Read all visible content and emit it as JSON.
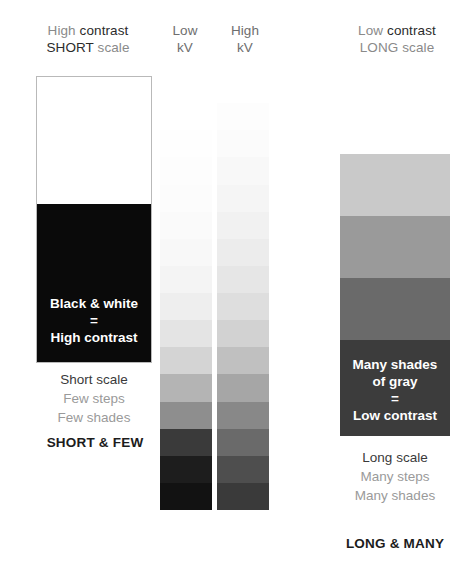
{
  "headers": {
    "left": {
      "line1_a": "High",
      "line1_b": " contrast",
      "line2_a": "SHORT",
      "line2_b": " scale"
    },
    "lowkv": {
      "line1": "Low",
      "line2": "kV"
    },
    "highkv": {
      "line1": "High",
      "line2": "kV"
    },
    "right": {
      "line1_a": "Low",
      "line1_b": " contrast",
      "line2_a": "LONG",
      "line2_b": " scale"
    }
  },
  "left_panel": {
    "overlay_line1": "Black & white",
    "overlay_line2": "=",
    "overlay_line3": "High contrast",
    "caption_line1": "Short scale",
    "caption_line2": "Few steps",
    "caption_line3": "Few shades",
    "summary": "SHORT & FEW",
    "white_color": "#ffffff",
    "black_color": "#0a0a0a",
    "border_color": "#b9b9b9"
  },
  "right_panel": {
    "overlay_line1": "Many shades",
    "overlay_line2": "of gray",
    "overlay_line3": "=",
    "overlay_line4": "Low contrast",
    "caption_line1": "Long scale",
    "caption_line2": "Many steps",
    "caption_line3": "Many shades",
    "summary": "LONG & MANY"
  },
  "chart_data": {
    "type": "bar",
    "xlabel": "",
    "ylabel": "Optical density / gray shade",
    "legend_position": "top",
    "grid": false,
    "series": [
      {
        "name": "Low kV step wedge",
        "label": "Low kV",
        "step_count": 16,
        "note": "short scale — few steps, abrupt jump from white to black",
        "values_hex": [
          "#ffffff",
          "#ffffff",
          "#fefefe",
          "#fdfdfd",
          "#fcfcfc",
          "#fafafa",
          "#f8f8f8",
          "#f4f4f4",
          "#eeeeee",
          "#e4e4e4",
          "#d4d4d4",
          "#b4b4b4",
          "#8e8e8e",
          "#3a3a3a",
          "#1d1d1d",
          "#121212"
        ],
        "values_gray": [
          255,
          255,
          254,
          253,
          252,
          250,
          248,
          244,
          238,
          228,
          212,
          180,
          142,
          58,
          29,
          18
        ]
      },
      {
        "name": "High kV step wedge",
        "label": "High kV",
        "step_count": 16,
        "note": "long scale — many steps, gradual transition",
        "values_hex": [
          "#ffffff",
          "#fdfdfd",
          "#fbfbfb",
          "#f8f8f8",
          "#f5f5f5",
          "#f1f1f1",
          "#ececec",
          "#e6e6e6",
          "#dedede",
          "#d2d2d2",
          "#c0c0c0",
          "#a6a6a6",
          "#888888",
          "#6a6a6a",
          "#4e4e4e",
          "#3a3a3a"
        ],
        "values_gray": [
          255,
          253,
          251,
          248,
          245,
          241,
          236,
          230,
          222,
          210,
          192,
          166,
          136,
          106,
          78,
          58
        ]
      },
      {
        "name": "Low contrast long scale column",
        "label": "Low contrast / LONG scale",
        "step_count": 4,
        "values_hex": [
          "#c9c9c9",
          "#9a9a9a",
          "#6a6a6a",
          "#3c3c3c"
        ],
        "values_gray": [
          201,
          154,
          106,
          60
        ]
      }
    ],
    "annotations": [
      "Black & white = High contrast",
      "Many shades of gray = Low contrast",
      "SHORT & FEW",
      "LONG & MANY"
    ]
  }
}
